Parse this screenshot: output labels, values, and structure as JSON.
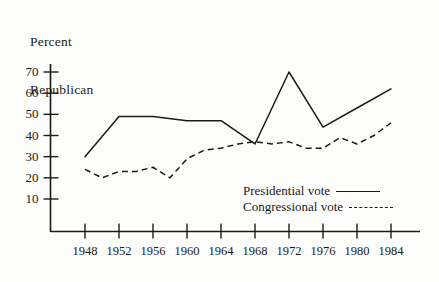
{
  "chart_data": {
    "type": "line",
    "title": "Percent Republican",
    "title_lines": [
      "Percent",
      "Republican"
    ],
    "xlabel": "",
    "ylabel": "Percent Republican",
    "x": [
      1948,
      1950,
      1952,
      1954,
      1956,
      1958,
      1960,
      1962,
      1964,
      1966,
      1968,
      1970,
      1972,
      1974,
      1976,
      1978,
      1980,
      1982,
      1984
    ],
    "categories": [
      "1948",
      "1952",
      "1956",
      "1960",
      "1964",
      "1968",
      "1972",
      "1976",
      "1980",
      "1984"
    ],
    "xticks": [
      1948,
      1952,
      1956,
      1960,
      1964,
      1968,
      1972,
      1976,
      1980,
      1984
    ],
    "yticks": [
      10,
      20,
      30,
      40,
      50,
      60,
      70
    ],
    "xlim": [
      1946,
      1986
    ],
    "ylim": [
      0,
      75
    ],
    "grid": false,
    "legend_position": "inside-lower-right",
    "series": [
      {
        "name": "Presidential vote",
        "style": "solid",
        "color": "#1a1a1a",
        "x": [
          1948,
          1952,
          1956,
          1960,
          1964,
          1968,
          1972,
          1976,
          1980,
          1984
        ],
        "values": [
          30,
          49,
          49,
          47,
          47,
          36,
          70,
          44,
          53,
          62
        ]
      },
      {
        "name": "Congressional vote",
        "style": "dashed",
        "color": "#1a1a1a",
        "x": [
          1948,
          1950,
          1952,
          1954,
          1956,
          1958,
          1960,
          1962,
          1964,
          1966,
          1968,
          1970,
          1972,
          1974,
          1976,
          1978,
          1980,
          1982,
          1984
        ],
        "values": [
          24,
          20,
          23,
          23,
          25,
          20,
          29,
          33,
          34,
          36,
          37,
          36,
          37,
          34,
          34,
          39,
          36,
          40,
          46
        ]
      }
    ]
  },
  "legend": {
    "items": [
      {
        "label": "Presidential vote",
        "style": "solid"
      },
      {
        "label": "Congressional vote",
        "style": "dashed"
      }
    ]
  },
  "axes": {
    "y_labels": [
      "70",
      "60",
      "50",
      "40",
      "30",
      "20",
      "10"
    ],
    "x_labels": [
      "1948",
      "1952",
      "1956",
      "1960",
      "1964",
      "1968",
      "1972",
      "1976",
      "1980",
      "1984"
    ]
  },
  "colors": {
    "ink": "#1a1a1a",
    "background": "#fdfdfb"
  }
}
